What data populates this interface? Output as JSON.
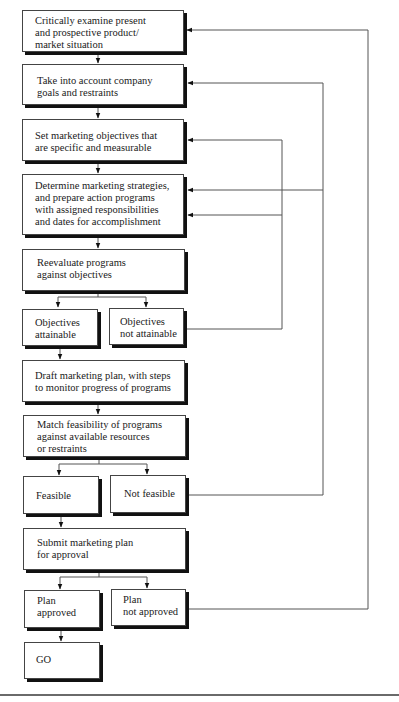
{
  "diagram": {
    "type": "flowchart",
    "title": "",
    "nodes": [
      {
        "id": "examine",
        "lines": [
          "Critically examine present",
          "and prospective product/",
          "market situation"
        ]
      },
      {
        "id": "goals",
        "lines": [
          "Take into account company",
          "goals and restraints"
        ]
      },
      {
        "id": "objectives",
        "lines": [
          "Set marketing objectives that",
          "are specific and measurable"
        ]
      },
      {
        "id": "strategies",
        "lines": [
          "Determine marketing strategies,",
          "and prepare action programs",
          "with assigned responsibilities",
          "and dates for accomplishment"
        ]
      },
      {
        "id": "reevaluate",
        "lines": [
          "Reevaluate programs",
          "against objectives"
        ]
      },
      {
        "id": "obj_attainable",
        "lines": [
          "Objectives",
          "attainable"
        ]
      },
      {
        "id": "obj_not_attainable",
        "lines": [
          "Objectives",
          "not attainable"
        ]
      },
      {
        "id": "draft",
        "lines": [
          "Draft marketing plan, with steps",
          "to monitor progress of programs"
        ]
      },
      {
        "id": "match",
        "lines": [
          "Match feasibility of programs",
          "against available resources",
          "or restraints"
        ]
      },
      {
        "id": "feasible",
        "lines": [
          "Feasible"
        ]
      },
      {
        "id": "not_feasible",
        "lines": [
          "Not feasible"
        ]
      },
      {
        "id": "submit",
        "lines": [
          "Submit marketing plan",
          "for approval"
        ]
      },
      {
        "id": "approved",
        "lines": [
          "Plan",
          "approved"
        ]
      },
      {
        "id": "not_approved",
        "lines": [
          "Plan",
          "not approved"
        ]
      },
      {
        "id": "go",
        "lines": [
          "GO"
        ]
      }
    ],
    "edges": [
      {
        "from": "examine",
        "to": "goals"
      },
      {
        "from": "goals",
        "to": "objectives"
      },
      {
        "from": "objectives",
        "to": "strategies"
      },
      {
        "from": "strategies",
        "to": "reevaluate"
      },
      {
        "from": "reevaluate",
        "to": "obj_attainable"
      },
      {
        "from": "reevaluate",
        "to": "obj_not_attainable"
      },
      {
        "from": "obj_attainable",
        "to": "draft"
      },
      {
        "from": "obj_not_attainable",
        "to": "objectives",
        "type": "feedback"
      },
      {
        "from": "obj_not_attainable",
        "to": "strategies",
        "type": "feedback"
      },
      {
        "from": "draft",
        "to": "match"
      },
      {
        "from": "match",
        "to": "feasible"
      },
      {
        "from": "match",
        "to": "not_feasible"
      },
      {
        "from": "feasible",
        "to": "submit"
      },
      {
        "from": "not_feasible",
        "to": "goals",
        "type": "feedback"
      },
      {
        "from": "not_feasible",
        "to": "strategies",
        "type": "feedback"
      },
      {
        "from": "submit",
        "to": "approved"
      },
      {
        "from": "submit",
        "to": "not_approved"
      },
      {
        "from": "approved",
        "to": "go"
      },
      {
        "from": "not_approved",
        "to": "examine",
        "type": "feedback"
      }
    ]
  },
  "colors": {
    "line": "#555555",
    "border": "#444444",
    "shadow": "#111111",
    "text": "#1a1a1a",
    "background": "#ffffff"
  }
}
